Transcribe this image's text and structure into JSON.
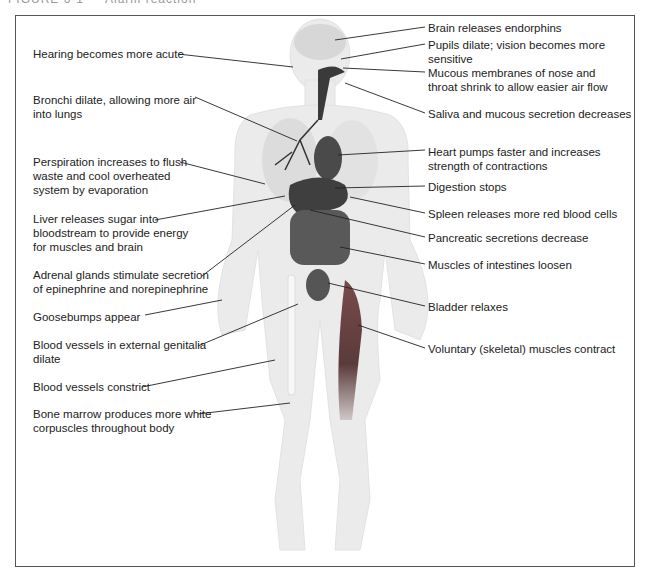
{
  "caption": "FIGURE 6-1 — Alarm reaction",
  "left_labels": [
    {
      "id": "hearing",
      "text": "Hearing becomes more acute",
      "x": 33,
      "y": 47
    },
    {
      "id": "bronchi",
      "text": "Bronchi dilate, allowing more air\ninto lungs",
      "x": 33,
      "y": 93
    },
    {
      "id": "perspiration",
      "text": "Perspiration increases to flush\nwaste and cool overheated\nsystem by evaporation",
      "x": 33,
      "y": 155
    },
    {
      "id": "liver",
      "text": "Liver releases sugar into\nbloodstream to provide energy\nfor muscles and brain",
      "x": 33,
      "y": 212
    },
    {
      "id": "adrenal",
      "text": "Adrenal glands stimulate secretion\nof epinephrine and norepinephrine",
      "x": 33,
      "y": 268
    },
    {
      "id": "goosebumps",
      "text": "Goosebumps appear",
      "x": 33,
      "y": 310
    },
    {
      "id": "genitalia",
      "text": "Blood vessels in external genitalia\ndilate",
      "x": 33,
      "y": 338
    },
    {
      "id": "constrict",
      "text": "Blood vessels constrict",
      "x": 33,
      "y": 380
    },
    {
      "id": "marrow",
      "text": "Bone marrow produces more white\ncorpuscles throughout body",
      "x": 33,
      "y": 407
    }
  ],
  "right_labels": [
    {
      "id": "brain",
      "text": "Brain releases endorphins",
      "x": 428,
      "y": 21
    },
    {
      "id": "pupils",
      "text": "Pupils dilate; vision becomes more\nsensitive",
      "x": 428,
      "y": 38
    },
    {
      "id": "mucous",
      "text": "Mucous membranes of nose and\nthroat shrink to allow easier air flow",
      "x": 428,
      "y": 66
    },
    {
      "id": "saliva",
      "text": "Saliva and mucous secretion decreases",
      "x": 428,
      "y": 107
    },
    {
      "id": "heart",
      "text": "Heart pumps faster and increases\nstrength of contractions",
      "x": 428,
      "y": 145
    },
    {
      "id": "digestion",
      "text": "Digestion stops",
      "x": 428,
      "y": 180
    },
    {
      "id": "spleen",
      "text": "Spleen releases more red blood cells",
      "x": 428,
      "y": 207
    },
    {
      "id": "pancreas",
      "text": "Pancreatic secretions decrease",
      "x": 428,
      "y": 231
    },
    {
      "id": "intestines",
      "text": "Muscles of intestines loosen",
      "x": 428,
      "y": 258
    },
    {
      "id": "bladder",
      "text": "Bladder relaxes",
      "x": 428,
      "y": 300
    },
    {
      "id": "voluntary",
      "text": "Voluntary (skeletal) muscles contract",
      "x": 428,
      "y": 342
    }
  ],
  "colors": {
    "frame": "#555555",
    "body": "#e9e9e9",
    "organ": "#4a4a4a",
    "muscle": "#6d4848",
    "line": "#222222"
  }
}
